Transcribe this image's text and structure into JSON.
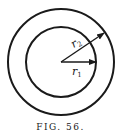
{
  "figure": {
    "caption": "FIG. 56.",
    "center": {
      "x": 61,
      "y": 62
    },
    "outer_circle": {
      "radius": 53,
      "stroke": "#1a1a1a"
    },
    "inner_circle": {
      "radius": 35,
      "stroke": "#1a1a1a"
    },
    "vectors": [
      {
        "label": "r",
        "subscript": "2",
        "to": "outer_circle"
      },
      {
        "label": "r",
        "subscript": "1",
        "to": "inner_circle"
      }
    ]
  }
}
